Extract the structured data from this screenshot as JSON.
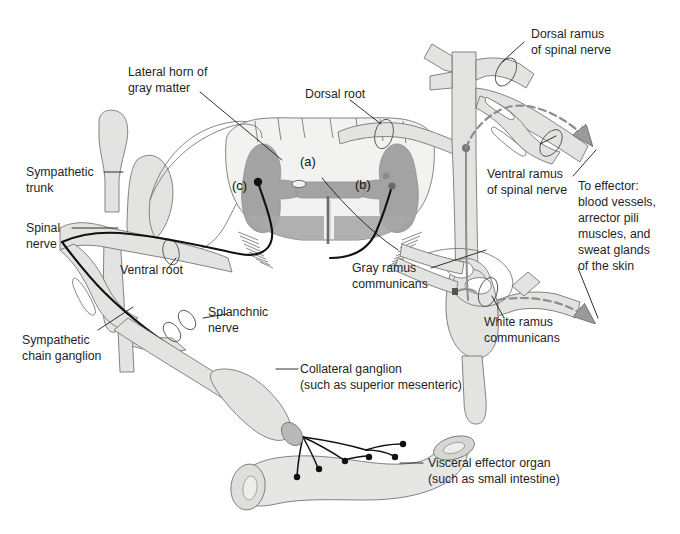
{
  "figure": {
    "background_color": "#ffffff",
    "palette": {
      "tissue_fill": "#e3e4e2",
      "tissue_fill_light": "#eeefed",
      "gray_matter": "#a3a3a3",
      "gray_matter_dark": "#8f8f8f",
      "white_matter": "#f2f2f0",
      "outline": "#6f6f6f",
      "nerve_line": "#111111",
      "postganglionic_gray": "#8d8d8d",
      "label_text": "#1f1f1f"
    }
  },
  "labels": {
    "lateral_horn": {
      "line1": "Lateral horn of",
      "line2": "gray matter"
    },
    "dorsal_root": {
      "line1": "Dorsal root"
    },
    "dorsal_ramus": {
      "line1": "Dorsal ramus",
      "line2": "of spinal nerve"
    },
    "ventral_ramus": {
      "line1": "Ventral ramus",
      "line2": "of spinal nerve"
    },
    "to_effector": {
      "line1": "To effector:",
      "line2": "blood vessels,",
      "line3": "arrector pili",
      "line4": "muscles, and",
      "line5": "sweat glands",
      "line6": "of the skin"
    },
    "sympathetic_trunk": {
      "line1": "Sympathetic",
      "line2": "trunk"
    },
    "spinal_nerve": {
      "line1": "Spinal",
      "line2": "nerve"
    },
    "ventral_root": {
      "line1": "Ventral root"
    },
    "sympathetic_chain_ganglion": {
      "line1": "Sympathetic",
      "line2": "chain ganglion"
    },
    "splanchnic_nerve": {
      "line1": "Splanchnic",
      "line2": "nerve"
    },
    "collateral_ganglion": {
      "line1": "Collateral ganglion",
      "line2": "(such as superior mesenteric)"
    },
    "gray_ramus": {
      "line1": "Gray ramus",
      "line2": "communicans"
    },
    "white_ramus": {
      "line1": "White ramus",
      "line2": "communicans"
    },
    "visceral_effector": {
      "line1": "Visceral effector organ",
      "line2": "(such as small intestine)"
    }
  },
  "markers": {
    "a": "(a)",
    "b": "(b)",
    "c": "(c)"
  }
}
